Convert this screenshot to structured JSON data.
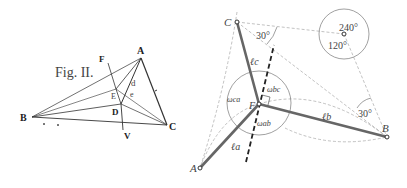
{
  "left_figure": {
    "title": "Fig. II.",
    "points": {
      "A": {
        "label": "A",
        "x": 141,
        "y": 58
      },
      "B": {
        "label": "B",
        "x": 32,
        "y": 117
      },
      "C": {
        "label": "C",
        "x": 167,
        "y": 125
      },
      "D": {
        "label": "D",
        "x": 121,
        "y": 104
      },
      "E": {
        "label": "E",
        "x": 116,
        "y": 89
      },
      "F": {
        "label": "F",
        "x": 105,
        "y": 60
      },
      "V": {
        "label": "V",
        "x": 123,
        "y": 131
      }
    },
    "small_labels": {
      "d": "d",
      "e": "e"
    }
  },
  "right_figure": {
    "points": {
      "A": {
        "label": "A",
        "x": 200,
        "y": 168
      },
      "B": {
        "label": "B",
        "x": 387,
        "y": 137
      },
      "C": {
        "label": "C",
        "x": 237,
        "y": 22
      },
      "F": {
        "label": "F",
        "x": 259,
        "y": 104
      }
    },
    "segment_labels": {
      "la": "ℓa",
      "lb": "ℓb",
      "lc": "ℓc"
    },
    "angle_labels": {
      "w_bc": "ωbc",
      "w_ca": "ωca",
      "w_ab": "ωab",
      "angle_c": "30°",
      "angle_b": "30°",
      "circle_top": "240°",
      "circle_bottom": "120°"
    }
  }
}
